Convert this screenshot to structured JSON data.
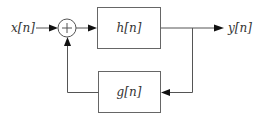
{
  "diagram": {
    "type": "block-diagram-feedback-loop",
    "input": {
      "label": "x[n]"
    },
    "summer": {
      "symbol": "+"
    },
    "forward_block": {
      "label": "h[n]"
    },
    "feedback_block": {
      "label": "g[n]"
    },
    "output": {
      "label": "y[n]"
    },
    "colors": {
      "line": "#555555",
      "arrowhead": "#111111",
      "text": "#333333",
      "background": "#ffffff"
    }
  }
}
